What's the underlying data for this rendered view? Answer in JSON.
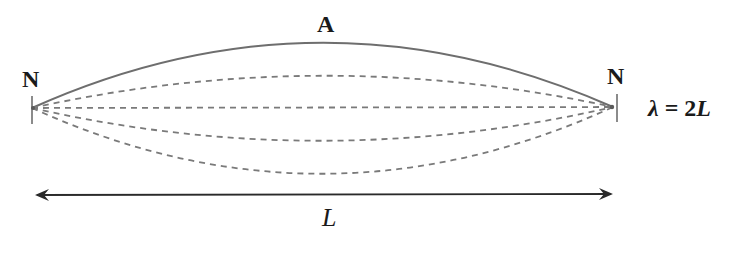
{
  "diagram": {
    "labels": {
      "antinode": "A",
      "node_left": "N",
      "node_right": "N",
      "length": "L",
      "wavelength_symbol": "λ",
      "wavelength_eq": "=",
      "wavelength_value_num": "2",
      "wavelength_value_var": "L"
    },
    "colors": {
      "curve": "#6e6e6e",
      "dashed": "#7a7a7a",
      "arrow": "#2a2a2a",
      "text": "#1a1a1a"
    },
    "geometry": {
      "left_node": [
        32,
        108
      ],
      "right_node": [
        613,
        107
      ],
      "solid_peak_y": 43,
      "dashed_peaks_y": [
        76,
        108,
        141,
        174
      ],
      "arrow_y": 195,
      "arrow_x": [
        37,
        611
      ]
    }
  }
}
